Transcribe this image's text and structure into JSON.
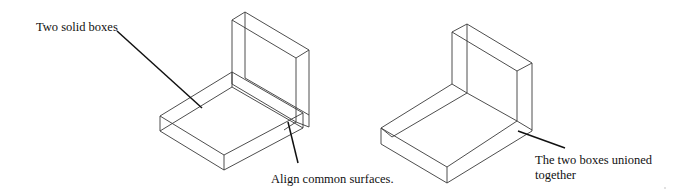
{
  "diagram": {
    "left_figure": {
      "label_top": "Two solid boxes",
      "label_bottom": "Align common surfaces."
    },
    "right_figure": {
      "label_line1": "The two boxes unioned",
      "label_line2": "together"
    },
    "colors": {
      "edge": "#3a3a3a",
      "leader": "#111111",
      "background": "#ffffff"
    }
  }
}
